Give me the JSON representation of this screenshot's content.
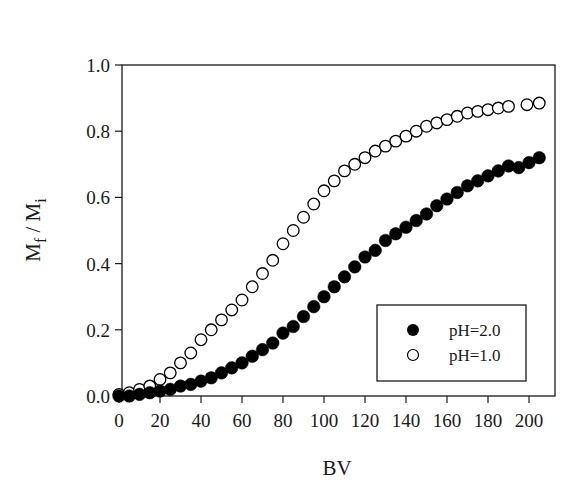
{
  "chart_data": {
    "type": "scatter",
    "title": "",
    "xlabel": "BV",
    "ylabel": "Mf / Mi",
    "ylabel_parts": {
      "main1": "M",
      "sub1": "f",
      "sep": " / ",
      "main2": "M",
      "sub2": "i"
    },
    "xlim": [
      0,
      210
    ],
    "ylim": [
      0,
      1.0
    ],
    "xticks": [
      0,
      20,
      40,
      60,
      80,
      100,
      120,
      140,
      160,
      180,
      200
    ],
    "xtick_labels": [
      "0",
      "20",
      "40",
      "60",
      "80",
      "100",
      "120",
      "140",
      "160",
      "180",
      "200"
    ],
    "yticks": [
      0.0,
      0.2,
      0.4,
      0.6,
      0.8,
      1.0
    ],
    "ytick_labels": [
      "0.0",
      "0.2",
      "0.4",
      "0.6",
      "0.8",
      "1.0"
    ],
    "grid": false,
    "legend_position": "lower right",
    "series": [
      {
        "name": "pH=2.0",
        "marker": "filled-circle",
        "color": "#000000",
        "x": [
          0,
          5,
          10,
          15,
          20,
          25,
          30,
          35,
          40,
          45,
          50,
          55,
          60,
          65,
          70,
          75,
          80,
          85,
          90,
          95,
          100,
          105,
          110,
          115,
          120,
          125,
          130,
          135,
          140,
          145,
          150,
          155,
          160,
          165,
          170,
          175,
          180,
          185,
          190,
          195,
          200,
          205
        ],
        "y": [
          0.0,
          0.0,
          0.005,
          0.01,
          0.015,
          0.02,
          0.03,
          0.035,
          0.045,
          0.055,
          0.07,
          0.085,
          0.1,
          0.12,
          0.14,
          0.16,
          0.19,
          0.21,
          0.24,
          0.27,
          0.3,
          0.33,
          0.36,
          0.39,
          0.42,
          0.44,
          0.47,
          0.49,
          0.51,
          0.53,
          0.55,
          0.575,
          0.595,
          0.615,
          0.635,
          0.65,
          0.665,
          0.68,
          0.695,
          0.69,
          0.705,
          0.72
        ]
      },
      {
        "name": "pH=1.0",
        "marker": "open-circle",
        "color": "#000000",
        "x": [
          0,
          5,
          10,
          15,
          20,
          25,
          30,
          35,
          40,
          45,
          50,
          55,
          60,
          65,
          70,
          75,
          80,
          85,
          90,
          95,
          100,
          105,
          110,
          115,
          120,
          125,
          130,
          135,
          140,
          145,
          150,
          155,
          160,
          165,
          170,
          175,
          180,
          185,
          190,
          199,
          205
        ],
        "y": [
          0.005,
          0.01,
          0.02,
          0.03,
          0.05,
          0.07,
          0.1,
          0.13,
          0.17,
          0.2,
          0.23,
          0.26,
          0.29,
          0.33,
          0.37,
          0.41,
          0.46,
          0.5,
          0.54,
          0.58,
          0.62,
          0.65,
          0.68,
          0.7,
          0.72,
          0.74,
          0.755,
          0.77,
          0.785,
          0.8,
          0.815,
          0.825,
          0.835,
          0.845,
          0.855,
          0.86,
          0.865,
          0.87,
          0.875,
          0.88,
          0.885
        ]
      }
    ]
  },
  "legend": {
    "items": [
      {
        "label": "pH=2.0",
        "marker": "filled-circle"
      },
      {
        "label": "pH=1.0",
        "marker": "open-circle"
      }
    ]
  },
  "colors": {
    "axis": "#1a1a1a",
    "marker": "#000000",
    "background": "#ffffff"
  }
}
